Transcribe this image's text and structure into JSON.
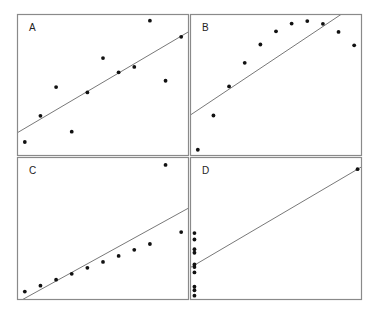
{
  "title": "",
  "panels": [
    {
      "label": "A"
    },
    {
      "label": "B"
    },
    {
      "label": "C"
    },
    {
      "label": "D"
    }
  ],
  "colors": {
    "frame": "#8a8a8a",
    "line": "#555555",
    "point": "#111111",
    "background": "#ffffff"
  },
  "chart_data": [
    {
      "type": "scatter",
      "title": "A",
      "xlabel": "",
      "ylabel": "",
      "xlim": [
        3.5,
        14.5
      ],
      "ylim": [
        3.5,
        11.2
      ],
      "grid": false,
      "x": [
        10,
        8,
        13,
        9,
        11,
        14,
        6,
        4,
        12,
        7,
        5
      ],
      "y": [
        8.04,
        6.95,
        7.58,
        8.81,
        8.33,
        9.96,
        7.24,
        4.26,
        10.84,
        4.82,
        5.68
      ],
      "fit_line": {
        "intercept": 3.0,
        "slope": 0.5
      }
    },
    {
      "type": "scatter",
      "title": "B",
      "xlabel": "",
      "ylabel": "",
      "xlim": [
        3.5,
        14.5
      ],
      "ylim": [
        2.8,
        9.6
      ],
      "grid": false,
      "x": [
        10,
        8,
        13,
        9,
        11,
        14,
        6,
        4,
        12,
        7,
        5
      ],
      "y": [
        9.14,
        8.14,
        8.74,
        8.77,
        9.26,
        8.1,
        6.13,
        3.1,
        9.13,
        7.26,
        4.74
      ],
      "fit_line": {
        "intercept": 3.0,
        "slope": 0.5
      }
    },
    {
      "type": "scatter",
      "title": "C",
      "xlabel": "",
      "ylabel": "",
      "xlim": [
        3.5,
        14.5
      ],
      "ylim": [
        4.9,
        13.2
      ],
      "grid": false,
      "x": [
        10,
        8,
        13,
        9,
        11,
        14,
        6,
        4,
        12,
        7,
        5
      ],
      "y": [
        7.46,
        6.77,
        12.74,
        7.11,
        7.81,
        8.84,
        6.08,
        5.39,
        8.15,
        6.42,
        5.73
      ],
      "fit_line": {
        "intercept": 3.0,
        "slope": 0.5
      }
    },
    {
      "type": "scatter",
      "title": "D",
      "xlabel": "",
      "ylabel": "",
      "xlim": [
        7.7,
        19.3
      ],
      "ylim": [
        5.0,
        13.2
      ],
      "grid": false,
      "x": [
        8,
        8,
        8,
        8,
        8,
        8,
        8,
        19,
        8,
        8,
        8
      ],
      "y": [
        6.58,
        5.76,
        7.71,
        8.84,
        8.47,
        7.04,
        5.25,
        12.5,
        5.56,
        7.91,
        6.89
      ],
      "fit_line": {
        "intercept": 3.0,
        "slope": 0.5
      }
    }
  ]
}
